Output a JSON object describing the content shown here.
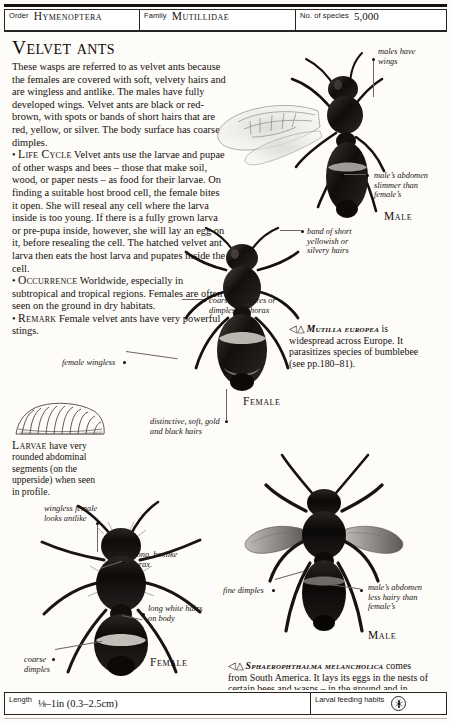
{
  "header": {
    "order_label": "Order",
    "order_value": "Hymenoptera",
    "family_label": "Family",
    "family_value": "Mutillidae",
    "species_label": "No. of species",
    "species_value": "5,000"
  },
  "title": "Velvet ants",
  "body": {
    "intro": "These wasps are referred to as velvet ants because the females are covered with soft, velvety hairs and are wingless and antlike. The males have fully developed wings. Velvet ants are black or red-brown, with spots or bands of short hairs that are red, yellow, or silver. The body surface has coarse dimples.",
    "life_cycle_heading": "Life Cycle",
    "life_cycle": "Velvet ants use the larvae and pupae of other wasps and bees – those that make soil, wood, or paper nests – as food for their larvae. On finding a suitable host brood cell, the female bites it open. She will reseal any cell where the larva inside is too young. If there is a fully grown larva or pre-pupa inside, however, she will lay an egg on it, before resealing the cell. The hatched velvet ant larva then eats the host larva and pupates inside the cell.",
    "occurrence_heading": "Occurrence",
    "occurrence": "Worldwide, especially in subtropical and tropical regions. Females are often seen on the ground in dry habitats.",
    "remark_heading": "Remark",
    "remark": "Female velvet ants have very powerful stings."
  },
  "larva_caption": {
    "lead": "Larvae",
    "text": " have very rounded abdominal segments (on the upperside) when seen in profile."
  },
  "annotations": {
    "males_have_wings": "males have\nwings",
    "male_abdomen_slimmer": "male’s abdomen\nslimmer than\nfemale’s",
    "band_of_short_hairs": "band of short\nyellowish or\nsilvery hairs",
    "coarse_punctures": "coarse punctures or\ndimples on thorax",
    "female_wingless": "female wingless",
    "distinctive_hairs": "distinctive, soft, gold\nand black hairs",
    "wingless_female_antlike": "wingless female\nlooks antlike",
    "strong_boxlike_thorax": "strong, boxlike\nthorax",
    "long_white_hairs": "long white hairs\non body",
    "coarse_dimples": "coarse\ndimples",
    "fine_dimples": "fine dimples",
    "male_abdomen_less_hairy": "male’s abdomen\nless hairy than\nfemale’s"
  },
  "sex_captions": {
    "male_top": "Male",
    "female_top": "Female",
    "female_bottom": "Female",
    "male_bottom": "Male"
  },
  "species_captions": {
    "mutilla": {
      "marker": "◁△",
      "name": "Mutilla europea",
      "text": " is widespread across Europe. It parasitizes species of bumblebee (see pp.180–81)."
    },
    "sphaerophthalma": {
      "marker": "◁△",
      "name": "Sphaerophthalma melancholica",
      "text": " comes from South America. It lays its eggs in the nests of certain bees and wasps – in the ground and in plant stems respectively."
    }
  },
  "footer": {
    "length_label": "Length",
    "length_value": "⅛–1in (0.3–2.5cm)",
    "habits_label": "Larval feeding habits",
    "habits_icon": "insect-in-circle-icon",
    "habits_icon_glyph": "⁂"
  }
}
